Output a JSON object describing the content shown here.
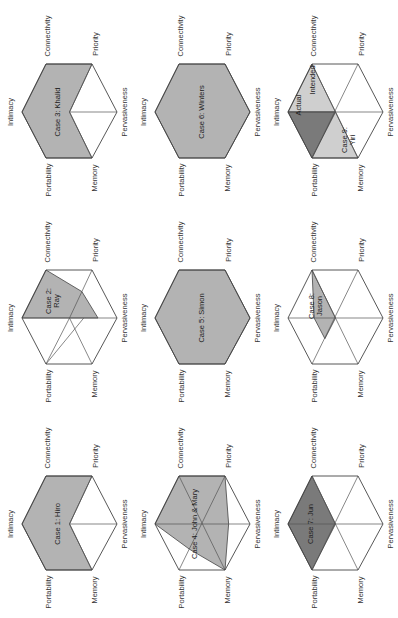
{
  "figure": {
    "axes": [
      "Intimacy",
      "Connectivity",
      "Priority",
      "Pervasiveness",
      "Memory",
      "Portability"
    ],
    "colors": {
      "light": "#b3b3b3",
      "dark": "#7a7a7a",
      "stroke": "#444444",
      "grid": "#555555"
    },
    "cases": [
      {
        "id": "case3",
        "label": "Case 3: Khalid",
        "col": 0,
        "row": 0
      },
      {
        "id": "case6",
        "label": "Case 6: Winters",
        "col": 1,
        "row": 0
      },
      {
        "id": "case9",
        "label": "Case 9:\nYiri",
        "col": 2,
        "row": 0,
        "extra": [
          "Actual",
          "Intended"
        ]
      },
      {
        "id": "case2",
        "label": "Case 2:\nRay",
        "col": 0,
        "row": 1
      },
      {
        "id": "case5",
        "label": "Case 5: Simon",
        "col": 1,
        "row": 1
      },
      {
        "id": "case8",
        "label": "Case 8:\nJason",
        "col": 2,
        "row": 1
      },
      {
        "id": "case1",
        "label": "Case 1: Hiro",
        "col": 0,
        "row": 2
      },
      {
        "id": "case4",
        "label": "Case 4: John & Mary",
        "col": 1,
        "row": 2
      },
      {
        "id": "case7",
        "label": "Case 7: Jun",
        "col": 2,
        "row": 2
      }
    ]
  },
  "labels": {
    "intimacy": "Intimacy",
    "connectivity": "Connectivity",
    "priority": "Priority",
    "pervasiveness": "Pervasiveness",
    "memory": "Memory",
    "portability": "Portability",
    "case1": "Case 1: Hiro",
    "case2_a": "Case 2:",
    "case2_b": "Ray",
    "case3": "Case 3: Khalid",
    "case4": "Case 4: John & Mary",
    "case5": "Case 5: Simon",
    "case6": "Case 6: Winters",
    "case7": "Case 7: Jun",
    "case8_a": "Case 8:",
    "case8_b": "Jason",
    "case9_a": "Case 9:",
    "case9_b": "Yiri",
    "actual": "Actual",
    "intended": "Intended"
  }
}
